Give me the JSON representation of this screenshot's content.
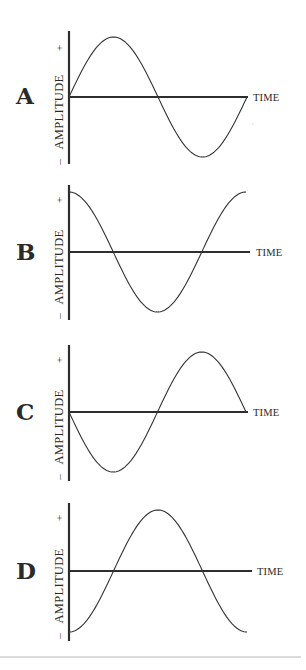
{
  "figure": {
    "x_axis_label": "TIME",
    "y_axis_label": "AMPLITUDE",
    "y_plus": "+",
    "y_minus": "–",
    "colors": {
      "ink": "#2e2e2e",
      "rule": "#b8b8b8",
      "background": "#ffffff"
    }
  },
  "panels": [
    {
      "letter": "A",
      "wave": "sine",
      "description": "starts at zero, rises to positive peak, falls through zero to negative trough, returns to zero"
    },
    {
      "letter": "B",
      "wave": "cosine",
      "description": "starts at positive peak, falls through zero to negative trough, rises back to positive peak"
    },
    {
      "letter": "C",
      "wave": "inverted sine",
      "description": "starts at zero, falls to negative trough, rises through zero to positive peak, returns to zero"
    },
    {
      "letter": "D",
      "wave": "inverted cosine",
      "description": "starts at negative trough, rises through zero to positive peak, falls back to negative trough"
    }
  ],
  "chart_data": [
    {
      "type": "line",
      "title": "A",
      "xlabel": "TIME",
      "ylabel": "AMPLITUDE",
      "x": [
        0,
        0.25,
        0.5,
        0.75,
        1.0
      ],
      "values": [
        0,
        1,
        0,
        -1,
        0
      ],
      "ylim": [
        -1,
        1
      ],
      "grid": false
    },
    {
      "type": "line",
      "title": "B",
      "xlabel": "TIME",
      "ylabel": "AMPLITUDE",
      "x": [
        0,
        0.25,
        0.5,
        0.75,
        1.0
      ],
      "values": [
        1,
        0,
        -1,
        0,
        1
      ],
      "ylim": [
        -1,
        1
      ],
      "grid": false
    },
    {
      "type": "line",
      "title": "C",
      "xlabel": "TIME",
      "ylabel": "AMPLITUDE",
      "x": [
        0,
        0.25,
        0.5,
        0.75,
        1.0
      ],
      "values": [
        0,
        -1,
        0,
        1,
        0
      ],
      "ylim": [
        -1,
        1
      ],
      "grid": false
    },
    {
      "type": "line",
      "title": "D",
      "xlabel": "TIME",
      "ylabel": "AMPLITUDE",
      "x": [
        0,
        0.25,
        0.5,
        0.75,
        1.0
      ],
      "values": [
        -1,
        0,
        1,
        0,
        -1
      ],
      "ylim": [
        -1,
        1
      ],
      "grid": false
    }
  ]
}
